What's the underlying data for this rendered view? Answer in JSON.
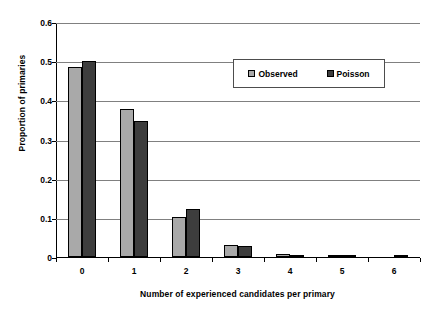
{
  "chart_data": {
    "type": "bar",
    "title": "",
    "xlabel": "Number of experienced candidates per primary",
    "ylabel": "Proportion of primaries",
    "categories": [
      "0",
      "1",
      "2",
      "3",
      "4",
      "5",
      "6"
    ],
    "series": [
      {
        "name": "Observed",
        "color": "#a9a9a9",
        "values": [
          0.485,
          0.377,
          0.101,
          0.03,
          0.007,
          0.004,
          0.0
        ]
      },
      {
        "name": "Poisson",
        "color": "#3d3d3d",
        "values": [
          0.5,
          0.347,
          0.122,
          0.028,
          0.006,
          0.003,
          0.002
        ]
      }
    ],
    "ylim": [
      0,
      0.6
    ],
    "ytick_labels": [
      "0.6",
      "0.5",
      "0.4",
      "0.3",
      "0.2",
      "0.1",
      "0"
    ],
    "ytick_values": [
      0.6,
      0.5,
      0.4,
      0.3,
      0.2,
      0.1,
      0
    ],
    "grid": "horizontal",
    "legend_position": "upper-right-inside",
    "legend_entries": [
      "Observed",
      "Poisson"
    ]
  }
}
